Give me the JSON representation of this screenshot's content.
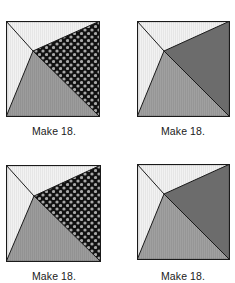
{
  "diagram": {
    "colors": {
      "light": "#f0f0f0",
      "medium": "#9a9a9a",
      "dark": "#6a6a6a",
      "print_bg": "#111111",
      "print_dot": "#a8a8a8",
      "outline": "#1a1a1a"
    },
    "blocks": [
      {
        "id": "tl",
        "variant": "print",
        "label": "Make 18."
      },
      {
        "id": "tr",
        "variant": "solid",
        "label": "Make 18."
      },
      {
        "id": "bl",
        "variant": "print",
        "label": "Make 18."
      },
      {
        "id": "br",
        "variant": "solid",
        "label": "Make 18."
      }
    ]
  }
}
